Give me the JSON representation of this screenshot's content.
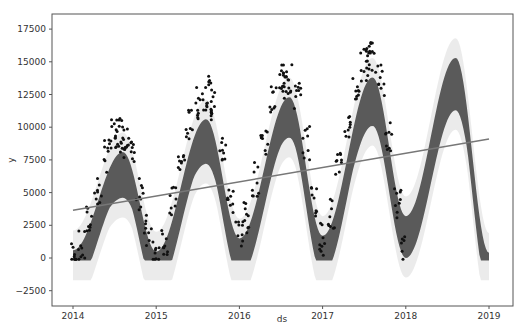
{
  "chart_data": {
    "type": "scatter",
    "title": "",
    "xlabel": "ds",
    "ylabel": "y",
    "x_ticks": [
      "2014",
      "2015",
      "2016",
      "2017",
      "2018",
      "2019"
    ],
    "y_ticks": [
      -2500,
      0,
      2500,
      5000,
      7500,
      10000,
      12500,
      15000,
      17500
    ],
    "xlim": [
      2013.9,
      2019.3
    ],
    "ylim": [
      -3000,
      18700
    ],
    "grid": false,
    "legend": null,
    "series": [
      {
        "name": "trend",
        "type": "line",
        "color": "#777777",
        "x": [
          2014.0,
          2019.0
        ],
        "values": [
          3650,
          9100
        ]
      },
      {
        "name": "yhat (forecast band centre)",
        "type": "area",
        "color": "#555555",
        "x": [
          2014.0,
          2014.6,
          2015.0,
          2015.6,
          2016.0,
          2016.6,
          2017.0,
          2017.6,
          2018.0,
          2018.6,
          2019.0
        ],
        "values": [
          600,
          8100,
          500,
          10600,
          1500,
          12300,
          1700,
          13800,
          3200,
          15300,
          400
        ],
        "lower_values": [
          0,
          4600,
          0,
          7200,
          0,
          9200,
          0,
          10100,
          0,
          11300,
          0
        ]
      },
      {
        "name": "observed y",
        "type": "scatter",
        "color": "#111111",
        "x": [
          2014.02,
          2014.1,
          2014.2,
          2014.3,
          2014.4,
          2014.5,
          2014.55,
          2014.6,
          2014.65,
          2014.7,
          2014.8,
          2014.9,
          2015.0,
          2015.1,
          2015.2,
          2015.3,
          2015.4,
          2015.5,
          2015.6,
          2015.65,
          2015.7,
          2015.8,
          2015.9,
          2016.0,
          2016.1,
          2016.2,
          2016.3,
          2016.4,
          2016.5,
          2016.55,
          2016.6,
          2016.7,
          2016.8,
          2016.9,
          2017.0,
          2017.1,
          2017.2,
          2017.3,
          2017.4,
          2017.5,
          2017.55,
          2017.6,
          2017.7,
          2017.8,
          2017.9,
          2017.98
        ],
        "values": [
          100,
          800,
          2800,
          5200,
          7800,
          9300,
          9700,
          9400,
          8800,
          7600,
          4800,
          2200,
          600,
          1500,
          4200,
          7200,
          10200,
          11800,
          12600,
          12300,
          11500,
          8200,
          4600,
          2000,
          3000,
          6000,
          9200,
          12000,
          13500,
          14000,
          13600,
          12400,
          8800,
          4500,
          1500,
          3400,
          6800,
          10200,
          13000,
          14800,
          15700,
          15200,
          13700,
          9200,
          4200,
          500
        ]
      }
    ]
  },
  "axes": {
    "x_label": "ds",
    "y_label": "y",
    "x_tick_labels": [
      "2014",
      "2015",
      "2016",
      "2017",
      "2018",
      "2019"
    ],
    "y_tick_labels": [
      "−2500",
      "0",
      "2500",
      "5000",
      "7500",
      "10000",
      "12500",
      "15000",
      "17500"
    ]
  },
  "colors": {
    "forecast_band": "#5a5a5a",
    "uncertainty_band": "#e6e6e6",
    "trend_line": "#777777",
    "points": "#111111",
    "frame": "#555555"
  }
}
